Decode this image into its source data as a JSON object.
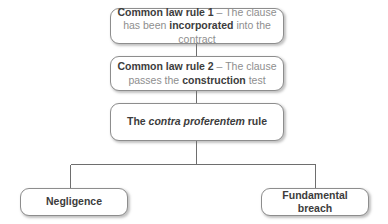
{
  "diagram": {
    "type": "flowchart",
    "colors": {
      "background": "#ffffff",
      "box_fill": "#ffffff",
      "box_border": "#8d8d8d",
      "connector": "#6e6e6e",
      "text_strong": "#3c3c3c",
      "text_normal": "#8e8e8e"
    },
    "nodes": {
      "rule_1": {
        "id": "common-law-rule-1",
        "runs": [
          {
            "text": "Common law rule 1",
            "style": "strong"
          },
          {
            "text": " – The clause has been ",
            "style": "normal"
          },
          {
            "text": "incorporated",
            "style": "strong"
          },
          {
            "text": " into the contract",
            "style": "normal"
          }
        ],
        "plain_text": "Common law rule 1 – The clause has been incorporated into the contract"
      },
      "rule_2": {
        "id": "common-law-rule-2",
        "runs": [
          {
            "text": "Common law rule 2",
            "style": "strong"
          },
          {
            "text": " – The clause passes the ",
            "style": "normal"
          },
          {
            "text": "construction",
            "style": "strong"
          },
          {
            "text": " test",
            "style": "normal"
          }
        ],
        "plain_text": "Common law rule 2 – The clause passes the construction test"
      },
      "contra_proferentem": {
        "id": "contra-proferentem-rule",
        "runs": [
          {
            "text": "The ",
            "style": "strong"
          },
          {
            "text": "contra proferentem",
            "style": "italic"
          },
          {
            "text": " rule",
            "style": "strong"
          }
        ],
        "plain_text": "The contra proferentem rule"
      },
      "negligence": {
        "id": "negligence",
        "runs": [
          {
            "text": "Negligence",
            "style": "strong"
          }
        ],
        "plain_text": "Negligence"
      },
      "fundamental_breach": {
        "id": "fundamental-breach",
        "runs": [
          {
            "text": "Fundamental breach",
            "style": "strong"
          }
        ],
        "plain_text": "Fundamental breach"
      }
    },
    "connectors": [
      {
        "name": "rule-1-to-rule-2",
        "from": "rule_1",
        "to": "rule_2",
        "kind": "vertical"
      },
      {
        "name": "rule-2-to-contra",
        "from": "rule_2",
        "to": "contra_proferentem",
        "kind": "vertical"
      },
      {
        "name": "contra-to-branch",
        "from": "contra_proferentem",
        "to": "branch-bar",
        "kind": "vertical"
      },
      {
        "name": "branch-to-negligence",
        "from": "branch-bar",
        "to": "negligence",
        "kind": "elbow-left"
      },
      {
        "name": "branch-to-breach",
        "from": "branch-bar",
        "to": "fundamental_breach",
        "kind": "elbow-right"
      }
    ]
  }
}
